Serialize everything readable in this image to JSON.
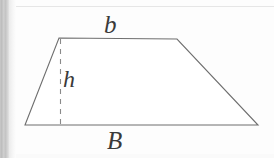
{
  "figure": {
    "kind": "geometry-diagram",
    "shape": "trapezoid",
    "caption_labels": {
      "minor_base": "b",
      "major_base": "B",
      "height": "h"
    },
    "colors": {
      "outline": "#6e6e6e",
      "height_line": "#8a8a8a",
      "label_text": "#3a3a3a",
      "page_background": "#fdfdfd",
      "scan_edge": "#c4c4c4"
    },
    "geometry": {
      "top_left": [
        59,
        38
      ],
      "top_right": [
        177,
        39
      ],
      "bottom_right": [
        258,
        125
      ],
      "bottom_left": [
        25,
        125
      ],
      "height_line_x": 60,
      "height_line_top_y": 38,
      "height_line_bottom_y": 125,
      "height_line_style": "dashed"
    }
  }
}
